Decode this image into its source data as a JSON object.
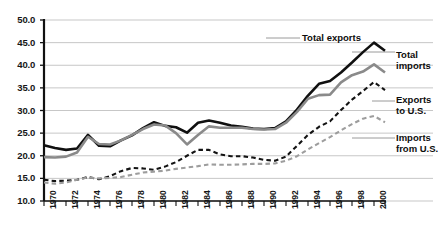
{
  "chart_data": {
    "type": "line",
    "title": "",
    "xlabel": "",
    "ylabel": "",
    "xlim": [
      1970,
      2001
    ],
    "ylim": [
      10.0,
      50.0
    ],
    "ytick_step": 5.0,
    "grid": true,
    "legend_position": "inline-right",
    "yticks": [
      "50.0",
      "45.0",
      "40.0",
      "35.0",
      "30.0",
      "25.0",
      "20.0",
      "15.0",
      "10.0"
    ],
    "xticks": [
      "1970",
      "1972",
      "1974",
      "1976",
      "1978",
      "1980",
      "1982",
      "1984",
      "1986",
      "1988",
      "1990",
      "1992",
      "1994",
      "1996",
      "1998",
      "2000"
    ],
    "x": [
      1970,
      1971,
      1972,
      1973,
      1974,
      1975,
      1976,
      1977,
      1978,
      1979,
      1980,
      1981,
      1982,
      1983,
      1984,
      1985,
      1986,
      1987,
      1988,
      1989,
      1990,
      1991,
      1992,
      1993,
      1994,
      1995,
      1996,
      1997,
      1998,
      1999,
      2000,
      2001
    ],
    "series": [
      {
        "name": "Total exports",
        "color": "#101010",
        "style": "solid",
        "width": 2.6,
        "label_text": "Total exports",
        "values": [
          22.3,
          21.7,
          21.3,
          21.6,
          24.6,
          22.2,
          22.1,
          23.4,
          24.5,
          26.1,
          27.4,
          26.6,
          26.3,
          25.1,
          27.3,
          27.8,
          27.3,
          26.7,
          26.4,
          26.0,
          25.9,
          26.1,
          27.6,
          30.2,
          33.3,
          35.9,
          36.5,
          38.4,
          40.6,
          42.9,
          45.0,
          43.2
        ]
      },
      {
        "name": "Total imports",
        "color": "#8a8a8a",
        "style": "solid",
        "width": 2.6,
        "label_text": "Total imports",
        "values": [
          19.7,
          19.6,
          19.8,
          20.7,
          24.2,
          22.6,
          22.5,
          23.4,
          24.6,
          25.9,
          26.9,
          26.7,
          25.0,
          22.5,
          24.6,
          26.5,
          26.2,
          26.2,
          26.2,
          25.9,
          25.8,
          25.9,
          27.3,
          29.7,
          32.6,
          33.4,
          33.5,
          36.2,
          37.8,
          38.6,
          40.2,
          38.4
        ]
      },
      {
        "name": "Exports to U.S.",
        "color": "#131313",
        "style": "dashed",
        "width": 2.1,
        "label_text": "Exports to U.S.",
        "values": [
          14.7,
          14.4,
          14.5,
          14.7,
          15.3,
          14.8,
          15.5,
          16.6,
          17.3,
          17.2,
          16.9,
          17.6,
          18.6,
          20.0,
          21.3,
          21.3,
          20.3,
          19.9,
          19.9,
          19.6,
          19.1,
          18.9,
          19.8,
          22.2,
          24.6,
          26.4,
          27.6,
          30.1,
          32.4,
          34.3,
          36.3,
          34.5
        ]
      },
      {
        "name": "Imports from U.S.",
        "color": "#9d9d9d",
        "style": "dashed",
        "width": 2.1,
        "label_text": "Imports from U.S.",
        "values": [
          14.1,
          13.8,
          14.1,
          14.7,
          15.2,
          15.0,
          15.1,
          15.3,
          15.8,
          16.3,
          16.5,
          16.7,
          17.1,
          17.4,
          17.7,
          18.1,
          18.0,
          18.0,
          18.1,
          18.2,
          18.2,
          18.3,
          18.9,
          19.9,
          21.4,
          22.8,
          24.1,
          25.6,
          27.0,
          28.2,
          28.8,
          27.4
        ]
      }
    ],
    "annotations": [
      {
        "id": "total-exports",
        "text": "Total exports"
      },
      {
        "id": "total-imports",
        "text": "Total imports"
      },
      {
        "id": "exports-to-us",
        "text": "Exports to U.S."
      },
      {
        "id": "imports-from-us",
        "text": "Imports from U.S."
      }
    ]
  }
}
